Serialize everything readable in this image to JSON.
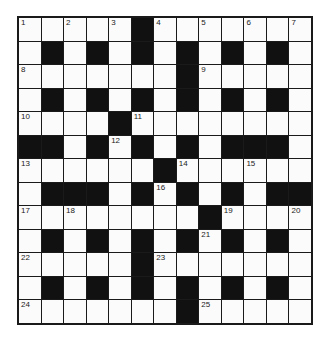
{
  "puzzle": {
    "rows": 13,
    "cols": 13,
    "colors": {
      "black": "#111111",
      "white": "#fbfbfb",
      "border": "#1a1a1a"
    },
    "grid": [
      ".....#.......",
      ".#.#.#.#.#.#.",
      ".......#.....",
      ".#.#.#.#.#.#.",
      "....#........",
      "##.#.#.#.###.",
      "......#......",
      ".###.#.#.#.##",
      "........#....",
      ".#.#.#.#.#.#.",
      ".....#.......",
      ".#.#.#.#.#.#.",
      ".......#....."
    ],
    "numbers": [
      {
        "n": "1",
        "r": 0,
        "c": 0
      },
      {
        "n": "2",
        "r": 0,
        "c": 2
      },
      {
        "n": "3",
        "r": 0,
        "c": 4
      },
      {
        "n": "4",
        "r": 0,
        "c": 6
      },
      {
        "n": "5",
        "r": 0,
        "c": 8
      },
      {
        "n": "6",
        "r": 0,
        "c": 10
      },
      {
        "n": "7",
        "r": 0,
        "c": 12
      },
      {
        "n": "8",
        "r": 2,
        "c": 0
      },
      {
        "n": "9",
        "r": 2,
        "c": 8
      },
      {
        "n": "10",
        "r": 4,
        "c": 0
      },
      {
        "n": "11",
        "r": 4,
        "c": 5
      },
      {
        "n": "12",
        "r": 5,
        "c": 4
      },
      {
        "n": "13",
        "r": 6,
        "c": 0
      },
      {
        "n": "14",
        "r": 6,
        "c": 7
      },
      {
        "n": "15",
        "r": 6,
        "c": 10
      },
      {
        "n": "16",
        "r": 7,
        "c": 6
      },
      {
        "n": "17",
        "r": 8,
        "c": 0
      },
      {
        "n": "18",
        "r": 8,
        "c": 2
      },
      {
        "n": "19",
        "r": 8,
        "c": 9
      },
      {
        "n": "20",
        "r": 8,
        "c": 12
      },
      {
        "n": "21",
        "r": 9,
        "c": 8
      },
      {
        "n": "22",
        "r": 10,
        "c": 0
      },
      {
        "n": "23",
        "r": 10,
        "c": 6
      },
      {
        "n": "24",
        "r": 12,
        "c": 0
      },
      {
        "n": "25",
        "r": 12,
        "c": 8
      }
    ]
  }
}
